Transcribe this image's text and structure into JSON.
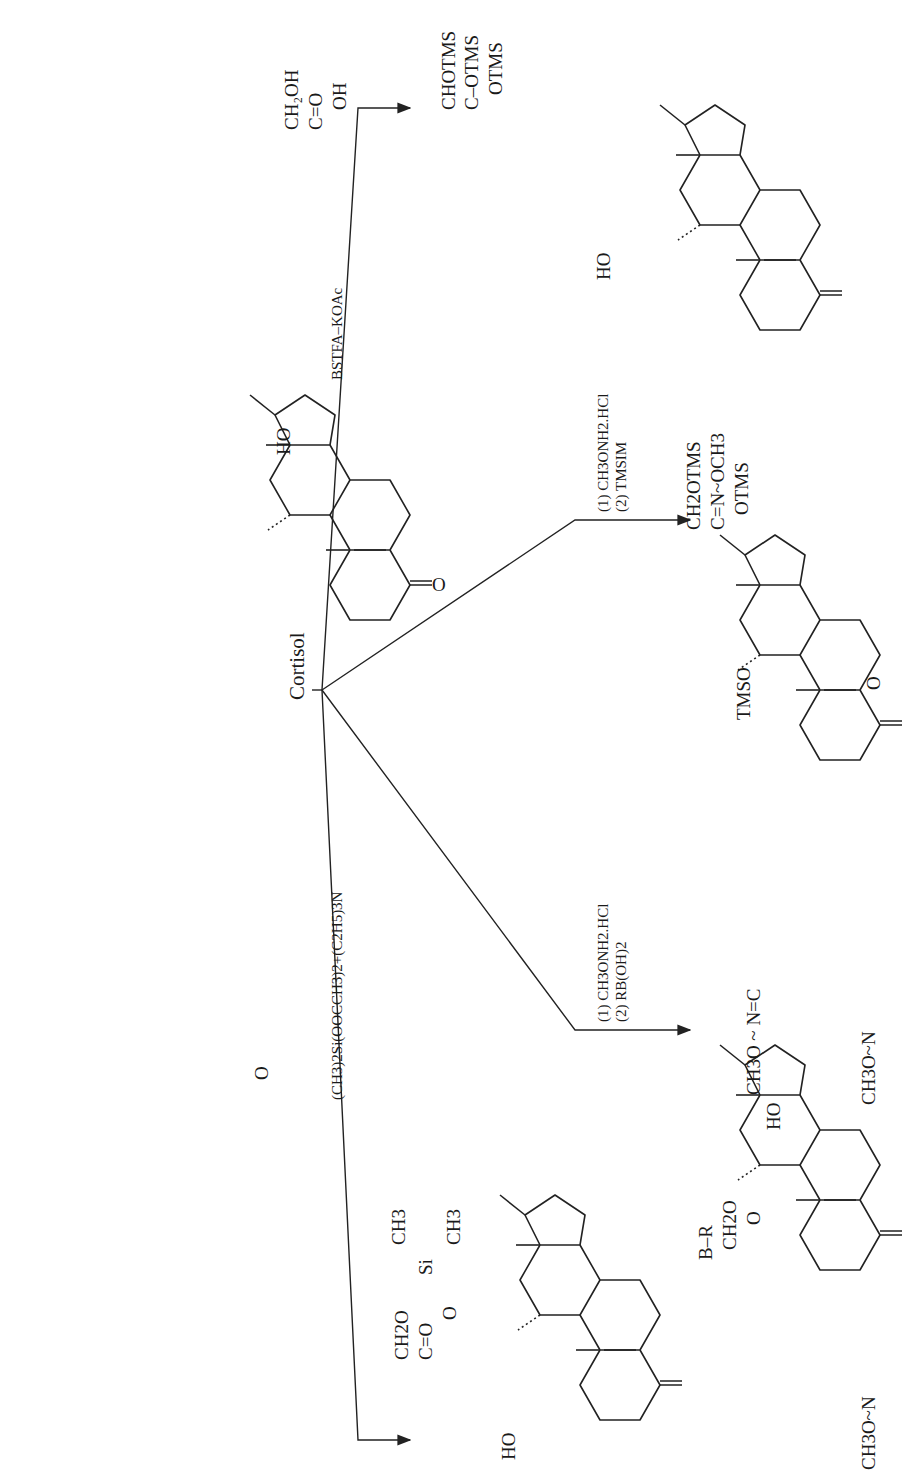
{
  "figure": {
    "orientation": "rotated-90-ccw",
    "center_label": "Cortisol",
    "starting_material": {
      "name": "Cortisol",
      "side_chain": [
        "CH2OH",
        "C=O",
        "OH"
      ],
      "c11_substituent": "HO",
      "c3_group": "O"
    },
    "reactions": [
      {
        "id": "bstfa",
        "reagent_lines": [
          "BSTFA–KOAc"
        ],
        "product": {
          "side_chain_top": "CHOTMS",
          "side_chain_mid": "C–OTMS",
          "c17_substituent": "OTMS",
          "c11_substituent": "HO",
          "c3_group": "O"
        }
      },
      {
        "id": "mo-tms",
        "reagent_lines": [
          "(1) CH3ONH2.HCl",
          "(2) TMSIM"
        ],
        "product": {
          "side_chain_top": "CH2OTMS",
          "side_chain_mid": "C=N~OCH3",
          "c17_substituent": "OTMS",
          "c11_substituent": "TMSO",
          "c3_group": "CH3O~N"
        }
      },
      {
        "id": "mo-boronate",
        "reagent_lines": [
          "(1) CH3ONH2.HCl",
          "(2) RB(OH)2"
        ],
        "product": {
          "ring_top": "B–R",
          "ring_left": "CH2O",
          "ring_right": "O",
          "side_chain_mid": "CH3O ~ N=C",
          "c11_substituent": "HO",
          "c3_group": "CH3O~N"
        }
      },
      {
        "id": "siliconide",
        "reagent_lines": [
          "(CH3)2Si(OOCCH3)2+(C2H5)3N"
        ],
        "product": {
          "si_methyls": [
            "CH3",
            "CH3"
          ],
          "si_label": "Si",
          "ring_left": "CH2O",
          "ring_mid": "C=O",
          "ring_right": "O",
          "c11_substituent": "HO",
          "c3_group": "O"
        }
      }
    ]
  }
}
